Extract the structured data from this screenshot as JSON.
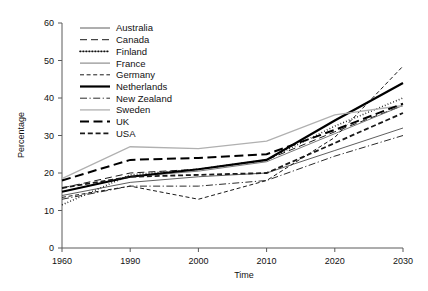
{
  "chart_data": {
    "type": "line",
    "title": "",
    "xlabel": "Time",
    "ylabel": "Percentage",
    "x": [
      "1960",
      "1990",
      "2000",
      "2010",
      "2020",
      "2030"
    ],
    "xlim": [
      0,
      5
    ],
    "ylim": [
      0,
      60
    ],
    "yticks": [
      0,
      10,
      20,
      30,
      40,
      50,
      60
    ],
    "grid": false,
    "legend_position": "top-left-inside",
    "series": [
      {
        "name": "Australia",
        "values": [
          14.0,
          17.5,
          19.0,
          20.0,
          26.0,
          32.0
        ],
        "style": "solid-thin",
        "color": "#4d4d4d",
        "width": 0.9
      },
      {
        "name": "Canada",
        "values": [
          16.0,
          20.0,
          21.0,
          23.5,
          31.0,
          38.0
        ],
        "style": "dashed",
        "color": "#1a1a1a",
        "width": 1.0
      },
      {
        "name": "Finland",
        "values": [
          11.5,
          19.5,
          21.0,
          23.5,
          32.5,
          40.0
        ],
        "style": "dotted",
        "color": "#111111",
        "width": 1.6
      },
      {
        "name": "France",
        "values": [
          15.0,
          19.0,
          20.5,
          23.0,
          30.5,
          38.0
        ],
        "style": "solid-thin",
        "color": "#6a6a6a",
        "width": 0.9
      },
      {
        "name": "Germany",
        "values": [
          13.5,
          16.5,
          13.0,
          18.0,
          29.5,
          48.5
        ],
        "style": "dash-short",
        "color": "#1a1a1a",
        "width": 1.0
      },
      {
        "name": "Netherlands",
        "values": [
          15.0,
          19.0,
          21.0,
          23.5,
          34.0,
          44.0
        ],
        "style": "solid-thick",
        "color": "#000000",
        "width": 2.2
      },
      {
        "name": "New Zealand",
        "values": [
          13.0,
          16.5,
          16.5,
          18.0,
          24.5,
          30.0
        ],
        "style": "dash-dot",
        "color": "#2b2b2b",
        "width": 1.0
      },
      {
        "name": "Sweden",
        "values": [
          18.5,
          27.0,
          26.5,
          28.5,
          35.5,
          38.0
        ],
        "style": "solid-light",
        "color": "#b0b0b0",
        "width": 1.3
      },
      {
        "name": "UK",
        "values": [
          18.0,
          23.5,
          24.0,
          25.0,
          31.5,
          38.5
        ],
        "style": "dash-long",
        "color": "#000000",
        "width": 2.0
      },
      {
        "name": "USA",
        "values": [
          16.0,
          19.0,
          19.5,
          20.0,
          28.0,
          36.0
        ],
        "style": "dash-med",
        "color": "#1a1a1a",
        "width": 1.8
      }
    ]
  },
  "axes": {
    "y_title": "Percentage",
    "x_title": "Time",
    "y_tick_labels": [
      "0",
      "10",
      "20",
      "30",
      "40",
      "50",
      "60"
    ],
    "x_tick_labels": [
      "1960",
      "1990",
      "2000",
      "2010",
      "2020",
      "2030"
    ]
  },
  "legend": {
    "entries": [
      "Australia",
      "Canada",
      "Finland",
      "France",
      "Germany",
      "Netherlands",
      "New Zealand",
      "Sweden",
      "UK",
      "USA"
    ]
  }
}
